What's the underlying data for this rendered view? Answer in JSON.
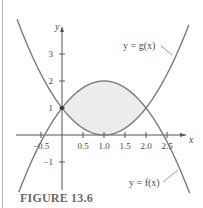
{
  "caption": "FIGURE 13.6",
  "chart_data": {
    "type": "line",
    "title": "",
    "xlabel": "x",
    "ylabel": "y",
    "xlim": [
      -1.07,
      3.0
    ],
    "ylim": [
      -2.1,
      4.0
    ],
    "grid": false,
    "x_ticks": [
      -0.5,
      0.5,
      1.0,
      1.5,
      2.0,
      2.5
    ],
    "x_tick_labels": [
      "-0.5",
      "0.5",
      "1.0",
      "1.5",
      "2.0",
      "2.5"
    ],
    "y_ticks": [
      3,
      2,
      1,
      -1
    ],
    "y_tick_labels": [
      "3",
      "2",
      "1",
      "−1"
    ],
    "series": [
      {
        "name": "y = g(x)",
        "formula": "(x-1)^2",
        "x": [
          -1.0,
          -0.5,
          0,
          0.5,
          1.0,
          1.5,
          2.0,
          2.5,
          3.0
        ],
        "values": [
          4.0,
          2.25,
          1.0,
          0.25,
          0.0,
          0.25,
          1.0,
          2.25,
          4.0
        ]
      },
      {
        "name": "y = f(x)",
        "formula": "2-(x-1)^2",
        "x": [
          -1.0,
          -0.5,
          0,
          0.5,
          1.0,
          1.5,
          2.0,
          2.5,
          3.0
        ],
        "values": [
          -2.0,
          -0.25,
          1.0,
          1.75,
          2.0,
          1.75,
          1.0,
          -0.25,
          -2.0
        ]
      }
    ],
    "shaded_region": {
      "between": [
        "y = f(x)",
        "y = g(x)"
      ],
      "x_range": [
        0,
        2
      ],
      "color": "#ececec"
    },
    "annotations": [
      {
        "text": "y = g(x)",
        "points_to": "g curve upper right"
      },
      {
        "text": "y = f(x)",
        "points_to": "f curve lower right"
      }
    ],
    "marked_point": [
      0,
      1
    ],
    "colors": {
      "curve": "#7a7a7a",
      "axis": "#555555",
      "shade": "#ececec"
    }
  },
  "labels": {
    "g_label": "y = g(x)",
    "f_label": "y = f(x)",
    "x_axis": "x",
    "y_axis": "y"
  }
}
